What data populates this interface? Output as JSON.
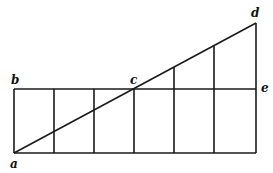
{
  "diagram": {
    "type": "geometric-construction",
    "labels": {
      "a": "a",
      "b": "b",
      "c": "c",
      "d": "d",
      "e": "e"
    },
    "points": {
      "a": [
        14,
        153
      ],
      "b": [
        14,
        89
      ],
      "c": [
        134,
        89
      ],
      "d": [
        256,
        23
      ],
      "e": [
        256,
        89
      ],
      "bottom_right": [
        256,
        153
      ]
    },
    "grid_verticals_x": [
      14,
      54,
      94,
      134,
      174,
      216,
      256
    ],
    "colors": {
      "line": "#1a1a1a",
      "background": "#ffffff"
    }
  }
}
